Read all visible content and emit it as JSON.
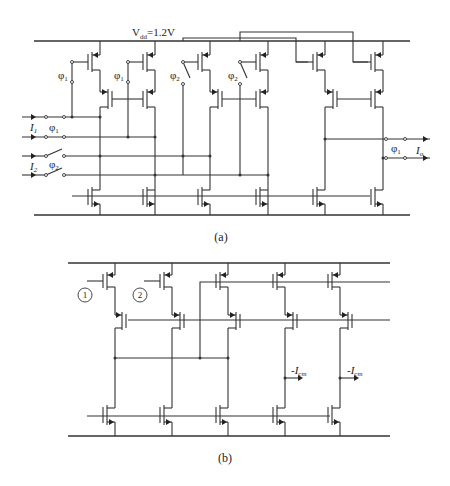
{
  "figure_a": {
    "caption": "(a)",
    "supply_label": "V",
    "supply_sub": "dd",
    "supply_value": "=1.2V",
    "input_1_label": "I",
    "input_1_sub": "1",
    "input_2_label": "I",
    "input_2_sub": "2",
    "output_label": "I",
    "output_sub": "o",
    "phi": "φ",
    "phi_1_sub": "1",
    "phi_2_sub": "2",
    "switch_labels": [
      "φ1",
      "φ1",
      "φ2",
      "φ2",
      "φ1",
      "φ2",
      "φ1"
    ]
  },
  "figure_b": {
    "caption": "(b)",
    "node_1_label": "1",
    "node_2_label": "2",
    "output_label": "-I",
    "output_sub": "cm",
    "outputs": [
      "-I_cm",
      "-I_cm"
    ]
  }
}
